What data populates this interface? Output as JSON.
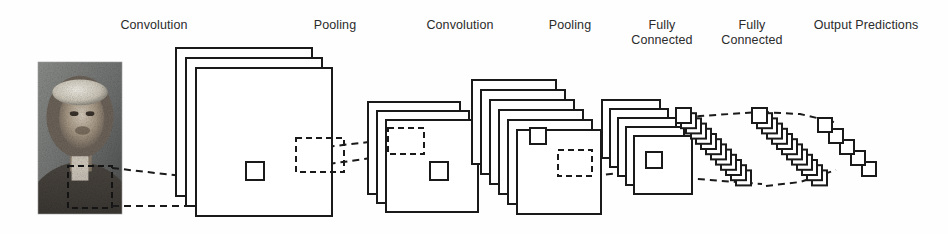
{
  "diagram": {
    "stroke_color": "#1a1a1a",
    "background_color": "#fefefe",
    "text_color": "#2b2b2b"
  },
  "labels": [
    {
      "id": "convolution-1",
      "text": "Convolution",
      "x": 94,
      "y": 18,
      "w": 120
    },
    {
      "id": "pooling-1",
      "text": "Pooling",
      "x": 285,
      "y": 18,
      "w": 100
    },
    {
      "id": "convolution-2",
      "text": "Convolution",
      "x": 400,
      "y": 18,
      "w": 120
    },
    {
      "id": "pooling-2",
      "text": "Pooling",
      "x": 520,
      "y": 18,
      "w": 100
    },
    {
      "id": "fully-connected-1",
      "text": "Fully\nConnected",
      "x": 616,
      "y": 18,
      "w": 92
    },
    {
      "id": "fully-connected-2",
      "text": "Fully\nConnected",
      "x": 706,
      "y": 18,
      "w": 92
    },
    {
      "id": "output-predictions",
      "text": "Output Predictions",
      "x": 790,
      "y": 18,
      "w": 152
    }
  ],
  "input_image": {
    "name": "rembrandt-self-portrait",
    "alt": "grayscale portrait photograph",
    "x": 38,
    "y": 62,
    "w": 84,
    "h": 152,
    "selection_box": {
      "x": 68,
      "y": 166,
      "w": 44,
      "h": 42
    }
  },
  "layers": [
    {
      "id": "conv1",
      "type": "convolution",
      "planes": 3,
      "x": 176,
      "y": 48,
      "w": 136,
      "h": 148,
      "dx": 10,
      "dy": 10,
      "receptive_square": {
        "x": 246,
        "y": 162,
        "w": 18,
        "h": 18
      },
      "dashed_region": {
        "x": 296,
        "y": 138,
        "w": 48,
        "h": 34
      }
    },
    {
      "id": "pool1",
      "type": "pooling",
      "planes": 3,
      "x": 368,
      "y": 102,
      "w": 92,
      "h": 92,
      "dx": 9,
      "dy": 9,
      "receptive_square": {
        "x": 430,
        "y": 162,
        "w": 18,
        "h": 18
      },
      "dashed_region": {
        "x": 388,
        "y": 128,
        "w": 36,
        "h": 26
      }
    },
    {
      "id": "conv2",
      "type": "convolution",
      "planes": 6,
      "x": 472,
      "y": 80,
      "w": 84,
      "h": 84,
      "dx": 9,
      "dy": 10,
      "receptive_square": {
        "x": 530,
        "y": 128,
        "w": 16,
        "h": 16
      },
      "dashed_region": {
        "x": 558,
        "y": 150,
        "w": 34,
        "h": 26
      }
    },
    {
      "id": "pool2",
      "type": "pooling",
      "planes": 5,
      "x": 602,
      "y": 100,
      "w": 58,
      "h": 58,
      "dx": 8,
      "dy": 9,
      "receptive_square": {
        "x": 646,
        "y": 152,
        "w": 16,
        "h": 16
      },
      "dashed_region": null
    },
    {
      "id": "fc1",
      "type": "fully-connected",
      "nodes": 13,
      "x": 676,
      "y": 108,
      "node_w": 15,
      "node_h": 15,
      "step_x": 5.0,
      "step_y": 5.2
    },
    {
      "id": "fc2",
      "type": "fully-connected",
      "nodes": 13,
      "x": 752,
      "y": 108,
      "node_w": 15,
      "node_h": 15,
      "step_x": 5.0,
      "step_y": 5.2
    },
    {
      "id": "output",
      "type": "output",
      "nodes": 5,
      "x": 818,
      "y": 118,
      "node_w": 14,
      "node_h": 14,
      "step_x": 11,
      "step_y": 11
    }
  ],
  "connectors": [
    {
      "id": "img-to-conv1-top",
      "points": "112,168 182,176 246,166"
    },
    {
      "id": "img-to-conv1-bottom",
      "points": "112,206 186,206 250,180"
    },
    {
      "id": "conv1-to-pool1-top",
      "points": "258,164 300,150 386,140"
    },
    {
      "id": "conv1-to-pool1-bot",
      "points": "258,178 300,168 386,156"
    },
    {
      "id": "pool1-to-conv2-top",
      "points": "424,132 470,130 532,130"
    },
    {
      "id": "pool1-to-conv2-bot",
      "points": "424,154 470,150 532,144"
    },
    {
      "id": "conv2-to-pool2-top",
      "points": "546,152 590,152 648,154"
    },
    {
      "id": "conv2-to-pool2-bot",
      "points": "546,176 592,176 650,170"
    },
    {
      "id": "pool2-to-fc1-top",
      "points": "662,124 700,116 760,112"
    },
    {
      "id": "pool2-to-fc1-bot",
      "points": "662,176 710,180 762,184"
    },
    {
      "id": "fc-to-output-top",
      "points": "762,112 800,114 834,122"
    },
    {
      "id": "fc-to-output-bot",
      "points": "766,186 800,182 836,170"
    }
  ]
}
